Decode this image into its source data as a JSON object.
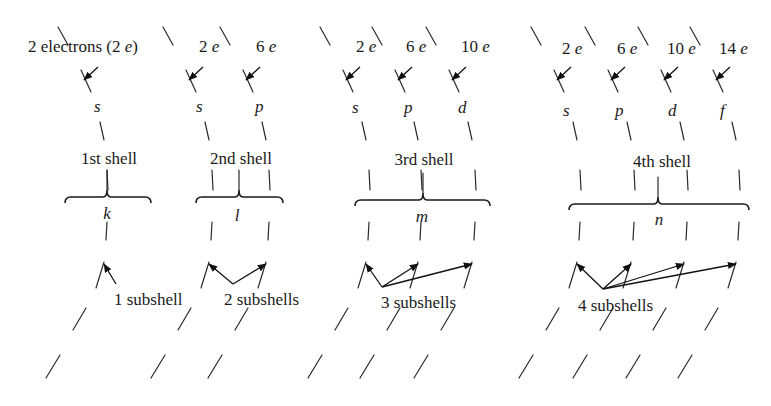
{
  "figure": {
    "colors": {
      "ink": "#1a1a1a",
      "background": "#ffffff"
    }
  },
  "shells": [
    {
      "name": "1st shell",
      "letter": "k",
      "subshell_count_label": "1 subshell",
      "subshells": [
        {
          "label": "s",
          "electrons": "2 electrons (2 e)"
        }
      ]
    },
    {
      "name": "2nd shell",
      "letter": "l",
      "subshell_count_label": "2 subshells",
      "subshells": [
        {
          "label": "s",
          "electrons": "2 e"
        },
        {
          "label": "p",
          "electrons": "6 e"
        }
      ]
    },
    {
      "name": "3rd shell",
      "letter": "m",
      "subshell_count_label": "3 subshells",
      "subshells": [
        {
          "label": "s",
          "electrons": "2 e"
        },
        {
          "label": "p",
          "electrons": "6 e"
        },
        {
          "label": "d",
          "electrons": "10 e"
        }
      ]
    },
    {
      "name": "4th shell",
      "letter": "n",
      "subshell_count_label": "4 subshells",
      "subshells": [
        {
          "label": "s",
          "electrons": "2 e"
        },
        {
          "label": "p",
          "electrons": "6 e"
        },
        {
          "label": "d",
          "electrons": "10 e"
        },
        {
          "label": "f",
          "electrons": "14 e"
        }
      ]
    }
  ],
  "layout": {
    "arcs": [
      {
        "shell": 0,
        "sub": 0,
        "x": 100
      },
      {
        "shell": 1,
        "sub": 0,
        "x": 205
      },
      {
        "shell": 1,
        "sub": 1,
        "x": 262
      },
      {
        "shell": 2,
        "sub": 0,
        "x": 362
      },
      {
        "shell": 2,
        "sub": 1,
        "x": 414
      },
      {
        "shell": 2,
        "sub": 2,
        "x": 468
      },
      {
        "shell": 3,
        "sub": 0,
        "x": 573
      },
      {
        "shell": 3,
        "sub": 1,
        "x": 627
      },
      {
        "shell": 3,
        "sub": 2,
        "x": 680
      },
      {
        "shell": 3,
        "sub": 3,
        "x": 732
      }
    ],
    "braces": [
      {
        "x1": 65,
        "x2": 151,
        "mid": 107,
        "y": 197
      },
      {
        "x1": 196,
        "x2": 283,
        "mid": 239,
        "y": 197
      },
      {
        "x1": 355,
        "x2": 490,
        "mid": 423,
        "y": 200
      },
      {
        "x1": 569,
        "x2": 749,
        "mid": 658,
        "y": 204
      }
    ],
    "shell_label_pos": [
      {
        "x": 109,
        "y": 164
      },
      {
        "x": 241,
        "y": 164
      },
      {
        "x": 424,
        "y": 165
      },
      {
        "x": 662,
        "y": 167
      }
    ],
    "letter_pos": [
      {
        "x": 107,
        "y": 218
      },
      {
        "x": 237,
        "y": 220
      },
      {
        "x": 422,
        "y": 222
      },
      {
        "x": 659,
        "y": 225
      }
    ],
    "count_label_pos": [
      {
        "x": 114,
        "y": 304
      },
      {
        "x": 224,
        "y": 304
      },
      {
        "x": 380,
        "y": 307
      },
      {
        "x": 577,
        "y": 310
      }
    ]
  }
}
